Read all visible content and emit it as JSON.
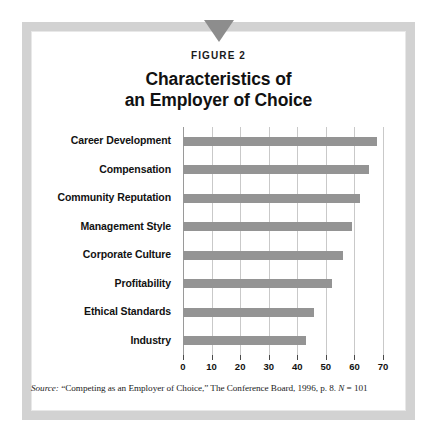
{
  "figure": {
    "label": "FIGURE 2",
    "title_line_1": "Characteristics of",
    "title_line_2": "an Employer of Choice",
    "marker_icon": "down-triangle-icon",
    "source_prefix": "Source:",
    "source_text": " “Competing as an Employer of Choice,” The Conference Board, 1996, p. 8. ",
    "source_n_symbol": "N",
    "source_n_value": " = 101",
    "frame_color": "#d2d2d2",
    "bar_color": "#949494",
    "grid_color": "#c9c9c9"
  },
  "chart_data": {
    "type": "bar",
    "orientation": "horizontal",
    "title": "Characteristics of an Employer of Choice",
    "subtitle": "FIGURE 2",
    "xlabel": "",
    "ylabel": "",
    "xlim": [
      0,
      70
    ],
    "xticks": [
      0,
      10,
      20,
      30,
      40,
      50,
      60,
      70
    ],
    "grid": true,
    "legend": "none",
    "categories": [
      "Career Development",
      "Compensation",
      "Community Reputation",
      "Management Style",
      "Corporate Culture",
      "Profitability",
      "Ethical Standards",
      "Industry"
    ],
    "values": [
      68,
      65,
      62,
      59,
      56,
      52,
      46,
      43
    ],
    "source": "“Competing as an Employer of Choice,” The Conference Board, 1996, p. 8. N = 101"
  }
}
